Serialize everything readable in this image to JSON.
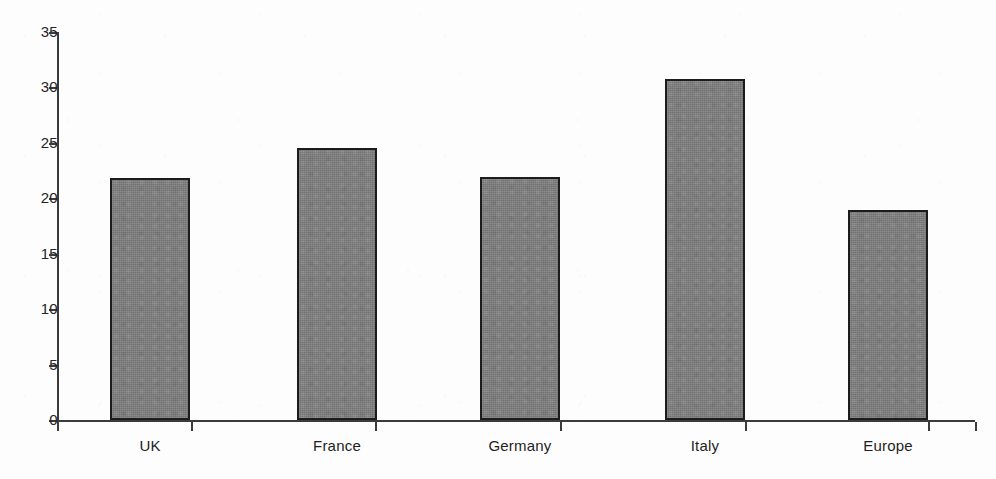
{
  "chart_data": {
    "type": "bar",
    "title": "",
    "subtitle": "",
    "xlabel": "",
    "ylabel": "",
    "categories": [
      "UK",
      "France",
      "Germany",
      "Italy",
      "Europe"
    ],
    "values": [
      21.8,
      24.5,
      21.9,
      30.8,
      18.9
    ],
    "ylim": [
      0,
      35
    ],
    "yticks": [
      0,
      5,
      10,
      15,
      20,
      25,
      30,
      35
    ],
    "ytick_labels": [
      "0",
      "5",
      "10",
      "15",
      "20",
      "25",
      "30",
      "35"
    ],
    "grid": false,
    "legend": null,
    "legend_position": "none",
    "bar_fill_color": "#7d7d7d",
    "bar_edge_color": "#1c1c1c",
    "axis_color": "#3b3b3b",
    "background_color": "#ffffff",
    "annotations": []
  },
  "axes": {
    "y_ticks": [
      {
        "label": "35",
        "value": 35
      },
      {
        "label": "30",
        "value": 30
      },
      {
        "label": "25",
        "value": 25
      },
      {
        "label": "20",
        "value": 20
      },
      {
        "label": "15",
        "value": 15
      },
      {
        "label": "10",
        "value": 10
      },
      {
        "label": "5",
        "value": 5
      },
      {
        "label": "0",
        "value": 0
      }
    ],
    "x_categories": [
      {
        "label": "UK"
      },
      {
        "label": "France"
      },
      {
        "label": "Germany"
      },
      {
        "label": "Italy"
      },
      {
        "label": "Europe"
      }
    ]
  }
}
